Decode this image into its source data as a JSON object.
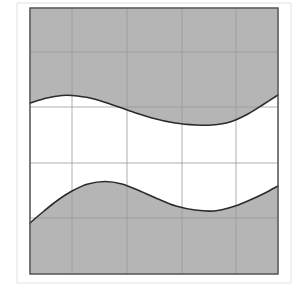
{
  "figure": {
    "width": 298,
    "height": 292,
    "background_color": "#ffffff"
  },
  "chart_data": {
    "type": "area",
    "title": "",
    "subtitle": "",
    "xlabel": "",
    "ylabel": "",
    "grid": true,
    "legend_position": "none",
    "annotations": [],
    "tick_labels": {
      "x": [],
      "y": []
    },
    "plot_box": {
      "left": 30,
      "top": 8,
      "right": 278,
      "bottom": 274,
      "border_color": "#555555",
      "border_width": 1.4
    },
    "axis_ranges": {
      "xlim": [
        30,
        278
      ],
      "ylim": [
        8,
        274
      ]
    },
    "grid_lines": {
      "color": "#9a9a9a",
      "width": 0.8,
      "vertical_x": [
        30,
        72,
        127,
        182,
        236,
        278
      ],
      "horizontal_y": [
        8,
        52,
        107,
        163,
        218,
        274
      ]
    },
    "outer_guides": {
      "color": "#d9d9d9",
      "width": 0.8,
      "vertical_x": [
        17,
        291
      ],
      "horizontal_y": [
        3,
        283
      ]
    },
    "series": [
      {
        "name": "upper-curve",
        "kind": "curve",
        "stroke": "#2b2b2b",
        "stroke_width": 1.6,
        "points": [
          [
            30,
            103
          ],
          [
            47,
            98
          ],
          [
            62,
            95.5
          ],
          [
            72,
            95.5
          ],
          [
            90,
            98
          ],
          [
            110,
            104
          ],
          [
            130,
            111
          ],
          [
            152,
            118
          ],
          [
            175,
            123
          ],
          [
            196,
            125
          ],
          [
            212,
            125
          ],
          [
            230,
            122
          ],
          [
            248,
            114
          ],
          [
            264,
            104
          ],
          [
            278,
            95
          ]
        ]
      },
      {
        "name": "lower-curve",
        "kind": "curve",
        "stroke": "#2b2b2b",
        "stroke_width": 1.6,
        "points": [
          [
            30,
            223
          ],
          [
            44,
            211
          ],
          [
            58,
            200
          ],
          [
            72,
            191
          ],
          [
            88,
            184
          ],
          [
            105,
            181.5
          ],
          [
            122,
            184
          ],
          [
            140,
            191
          ],
          [
            158,
            199
          ],
          [
            176,
            206
          ],
          [
            195,
            210
          ],
          [
            214,
            211
          ],
          [
            232,
            207
          ],
          [
            250,
            200
          ],
          [
            265,
            193
          ],
          [
            278,
            186
          ]
        ]
      }
    ],
    "regions": [
      {
        "name": "upper-shaded-region",
        "fill": "#b5b5b5",
        "description": "Area above the upper curve up to the top border"
      },
      {
        "name": "lower-shaded-region",
        "fill": "#b5b5b5",
        "description": "Area below the lower curve down to the bottom border"
      },
      {
        "name": "middle-unshaded-region",
        "fill": "#ffffff",
        "description": "Area between the two curves, left unshaded"
      }
    ]
  }
}
